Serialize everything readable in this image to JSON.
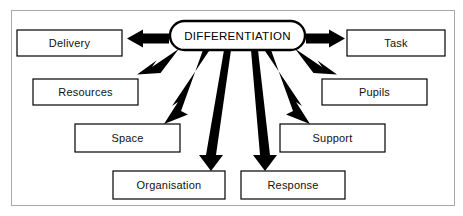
{
  "diagram": {
    "title": "DIFFERENTIATION",
    "type": "radial-spoke-diagram",
    "center": {
      "label": "DIFFERENTIATION",
      "shape": "rounded-rectangle",
      "x": 170,
      "y": 21,
      "width": 135,
      "height": 29
    },
    "frame": {
      "border_color": "#a8a8a8",
      "background": "#ffffff"
    },
    "colors": {
      "line": "#000000",
      "box_fill": "#ffffff",
      "box_border": "#000000",
      "text": "#111111",
      "frame_border": "#a8a8a8"
    },
    "nodes": [
      {
        "id": "delivery",
        "label": "Delivery",
        "x": 17,
        "y": 30,
        "width": 105,
        "height": 26,
        "direction": "left"
      },
      {
        "id": "task",
        "label": "Task",
        "x": 347,
        "y": 30,
        "width": 98,
        "height": 26,
        "direction": "right"
      },
      {
        "id": "resources",
        "label": "Resources",
        "x": 33,
        "y": 79,
        "width": 105,
        "height": 26,
        "direction": "lower-left"
      },
      {
        "id": "pupils",
        "label": "Pupils",
        "x": 322,
        "y": 79,
        "width": 105,
        "height": 26,
        "direction": "lower-right"
      },
      {
        "id": "space",
        "label": "Space",
        "x": 75,
        "y": 124,
        "width": 105,
        "height": 28,
        "direction": "lower-left"
      },
      {
        "id": "support",
        "label": "Support",
        "x": 280,
        "y": 124,
        "width": 105,
        "height": 28,
        "direction": "lower-right"
      },
      {
        "id": "organisation",
        "label": "Organisation",
        "x": 113,
        "y": 171,
        "width": 112,
        "height": 28,
        "direction": "down"
      },
      {
        "id": "response",
        "label": "Response",
        "x": 241,
        "y": 171,
        "width": 104,
        "height": 28,
        "direction": "down"
      }
    ],
    "arrows": [
      {
        "id": "arrow-to-delivery",
        "from": "center",
        "to": "delivery"
      },
      {
        "id": "arrow-to-task",
        "from": "center",
        "to": "task"
      },
      {
        "id": "arrow-to-resources",
        "from": "center",
        "to": "resources"
      },
      {
        "id": "arrow-to-pupils",
        "from": "center",
        "to": "pupils"
      },
      {
        "id": "arrow-to-space",
        "from": "center",
        "to": "space"
      },
      {
        "id": "arrow-to-support",
        "from": "center",
        "to": "support"
      },
      {
        "id": "arrow-to-organisation",
        "from": "center",
        "to": "organisation"
      },
      {
        "id": "arrow-to-response",
        "from": "center",
        "to": "response"
      }
    ]
  }
}
